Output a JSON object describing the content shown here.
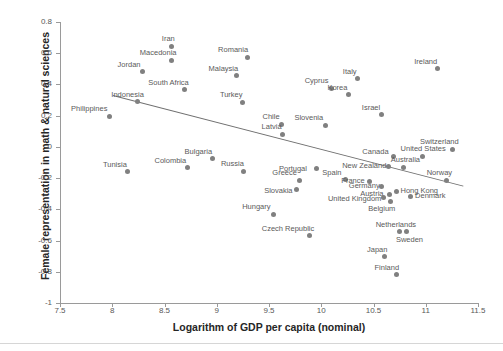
{
  "chart_data": {
    "type": "scatter",
    "title": "",
    "xlabel": "Logarithm of GDP per capita (nominal)",
    "ylabel": "Female representation in math & natural sciences",
    "xlim": [
      7.5,
      11.5
    ],
    "ylim": [
      -1,
      0.8
    ],
    "xticks": [
      "7.5",
      "8",
      "8.5",
      "9",
      "9.5",
      "10",
      "10.5",
      "11",
      "11.5"
    ],
    "xtick_values": [
      7.5,
      8,
      8.5,
      9,
      9.5,
      10,
      10.5,
      11,
      11.5
    ],
    "yticks": [
      "0.8",
      "0.6",
      "0.4",
      "0.2",
      "0",
      "-0.2",
      "-0.4",
      "-0.6",
      "-0.8",
      "-1"
    ],
    "ytick_values": [
      0.8,
      0.6,
      0.4,
      0.2,
      0,
      -0.2,
      -0.4,
      -0.6,
      -0.8,
      -1
    ],
    "grid": false,
    "legend": "none",
    "marker_color": "#808080",
    "trendline": {
      "visible": true,
      "color": "#6f6f6f",
      "x_start": 8.01,
      "y_start": 0.335,
      "x_end": 11.36,
      "y_end": -0.245
    },
    "points": [
      {
        "label": "Philippines",
        "x": 7.97,
        "y": 0.195,
        "label_dx": -38,
        "label_dy": -11
      },
      {
        "label": "Indonesia",
        "x": 8.24,
        "y": 0.29,
        "label_dx": -26,
        "label_dy": -11
      },
      {
        "label": "Tunisia",
        "x": 8.15,
        "y": -0.16,
        "label_dx": -25,
        "label_dy": -11
      },
      {
        "label": "Jordan",
        "x": 8.29,
        "y": 0.48,
        "label_dx": -25,
        "label_dy": -11
      },
      {
        "label": "Iran",
        "x": 8.57,
        "y": 0.645,
        "label_dx": -10,
        "label_dy": -11
      },
      {
        "label": "Macedonia",
        "x": 8.57,
        "y": 0.555,
        "label_dx": -32,
        "label_dy": -11
      },
      {
        "label": "South Africa",
        "x": 8.69,
        "y": 0.365,
        "label_dx": -36,
        "label_dy": -11
      },
      {
        "label": "Colombia",
        "x": 8.72,
        "y": -0.135,
        "label_dx": -33,
        "label_dy": -11
      },
      {
        "label": "Bulgaria",
        "x": 8.96,
        "y": -0.075,
        "label_dx": -28,
        "label_dy": -11
      },
      {
        "label": "Malaysia",
        "x": 9.19,
        "y": 0.455,
        "label_dx": -28,
        "label_dy": -11
      },
      {
        "label": "Romania",
        "x": 9.29,
        "y": 0.575,
        "label_dx": -29,
        "label_dy": -11
      },
      {
        "label": "Turkey",
        "x": 9.25,
        "y": 0.285,
        "label_dx": -23,
        "label_dy": -11
      },
      {
        "label": "Russia",
        "x": 9.26,
        "y": -0.155,
        "label_dx": -23,
        "label_dy": -11
      },
      {
        "label": "Chile",
        "x": 9.62,
        "y": 0.145,
        "label_dx": -19,
        "label_dy": -11
      },
      {
        "label": "Latvia",
        "x": 9.63,
        "y": 0.08,
        "label_dx": -21,
        "label_dy": -11
      },
      {
        "label": "Greece",
        "x": 9.79,
        "y": -0.215,
        "label_dx": -27,
        "label_dy": -11
      },
      {
        "label": "Slovakia",
        "x": 9.76,
        "y": -0.275,
        "label_dx": -32,
        "label_dy": -3
      },
      {
        "label": "Hungary",
        "x": 9.54,
        "y": -0.43,
        "label_dx": -31,
        "label_dy": -11
      },
      {
        "label": "Czech Republic",
        "x": 9.89,
        "y": -0.57,
        "label_dx": -48,
        "label_dy": -11
      },
      {
        "label": "Slovenia",
        "x": 10.04,
        "y": 0.14,
        "label_dx": -31,
        "label_dy": -11
      },
      {
        "label": "Cyprus",
        "x": 10.1,
        "y": 0.375,
        "label_dx": -27,
        "label_dy": -11
      },
      {
        "label": "Korea",
        "x": 10.26,
        "y": 0.335,
        "label_dx": -21,
        "label_dy": -11
      },
      {
        "label": "Italy",
        "x": 10.35,
        "y": 0.435,
        "label_dx": -15,
        "label_dy": -11
      },
      {
        "label": "Israel",
        "x": 10.58,
        "y": 0.205,
        "label_dx": -20,
        "label_dy": -11
      },
      {
        "label": "Portugal",
        "x": 9.95,
        "y": -0.14,
        "label_dx": -37,
        "label_dy": -4
      },
      {
        "label": "Spain",
        "x": 10.23,
        "y": -0.21,
        "label_dx": -23,
        "label_dy": -11
      },
      {
        "label": "France",
        "x": 10.46,
        "y": -0.22,
        "label_dx": -28,
        "label_dy": -4
      },
      {
        "label": "New Zealand",
        "x": 10.64,
        "y": -0.125,
        "label_dx": -46,
        "label_dy": -4
      },
      {
        "label": "Canada",
        "x": 10.69,
        "y": -0.06,
        "label_dx": -31,
        "label_dy": -8
      },
      {
        "label": "United States",
        "x": 10.97,
        "y": -0.06,
        "label_dx": -22,
        "label_dy": -11
      },
      {
        "label": "Switzerland",
        "x": 11.26,
        "y": -0.015,
        "label_dx": -33,
        "label_dy": -11
      },
      {
        "label": "Ireland",
        "x": 11.11,
        "y": 0.5,
        "label_dx": -23,
        "label_dy": -11
      },
      {
        "label": "Australia",
        "x": 10.79,
        "y": -0.13,
        "label_dx": -13,
        "label_dy": -11
      },
      {
        "label": "Germany",
        "x": 10.58,
        "y": -0.255,
        "label_dx": -33,
        "label_dy": -5
      },
      {
        "label": "Austria",
        "x": 10.65,
        "y": -0.305,
        "label_dx": -29,
        "label_dy": -5
      },
      {
        "label": "Hong Kong",
        "x": 10.72,
        "y": -0.285,
        "label_dx": 4,
        "label_dy": -4
      },
      {
        "label": "United Kingdom",
        "x": 10.6,
        "y": -0.325,
        "label_dx": -56,
        "label_dy": -3
      },
      {
        "label": "Belgium",
        "x": 10.66,
        "y": -0.35,
        "label_dx": -22,
        "label_dy": 3
      },
      {
        "label": "Denmark",
        "x": 10.85,
        "y": -0.315,
        "label_dx": 5,
        "label_dy": -4
      },
      {
        "label": "Norway",
        "x": 11.2,
        "y": -0.215,
        "label_dx": -20,
        "label_dy": -11
      },
      {
        "label": "Netherlands",
        "x": 10.75,
        "y": -0.545,
        "label_dx": -24,
        "label_dy": -11
      },
      {
        "label": "Sweden",
        "x": 10.82,
        "y": -0.545,
        "label_dx": -11,
        "label_dy": 4
      },
      {
        "label": "Japan",
        "x": 10.61,
        "y": -0.705,
        "label_dx": -18,
        "label_dy": -11
      },
      {
        "label": "Finland",
        "x": 10.72,
        "y": -0.82,
        "label_dx": -22,
        "label_dy": -11
      }
    ]
  }
}
